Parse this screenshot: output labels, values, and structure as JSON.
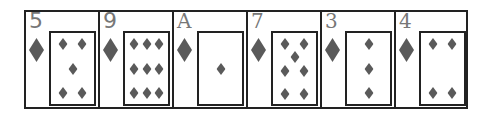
{
  "colors": {
    "pip": "#5a5a5a",
    "rank": "#777777",
    "border": "#222222"
  },
  "hand": [
    {
      "rank": "5",
      "suit": "diamond",
      "pips": [
        [
          27,
          16
        ],
        [
          73,
          16
        ],
        [
          50,
          50
        ],
        [
          27,
          84
        ],
        [
          73,
          84
        ]
      ]
    },
    {
      "rank": "9",
      "suit": "diamond",
      "pips": [
        [
          22,
          16
        ],
        [
          50,
          16
        ],
        [
          78,
          16
        ],
        [
          22,
          50
        ],
        [
          50,
          50
        ],
        [
          78,
          50
        ],
        [
          22,
          84
        ],
        [
          50,
          84
        ],
        [
          78,
          84
        ]
      ]
    },
    {
      "rank": "A",
      "suit": "diamond",
      "pips": [
        [
          50,
          50
        ]
      ]
    },
    {
      "rank": "7",
      "suit": "diamond",
      "pips": [
        [
          27,
          16
        ],
        [
          73,
          16
        ],
        [
          50,
          34
        ],
        [
          27,
          54
        ],
        [
          73,
          54
        ],
        [
          27,
          86
        ],
        [
          73,
          86
        ]
      ]
    },
    {
      "rank": "3",
      "suit": "diamond",
      "pips": [
        [
          50,
          16
        ],
        [
          50,
          50
        ],
        [
          50,
          84
        ]
      ]
    },
    {
      "rank": "4",
      "suit": "diamond",
      "pips": [
        [
          27,
          16
        ],
        [
          73,
          16
        ],
        [
          27,
          84
        ],
        [
          73,
          84
        ]
      ]
    }
  ]
}
